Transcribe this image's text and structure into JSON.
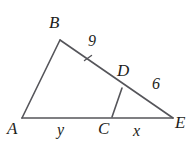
{
  "figure": {
    "background_color": "#ffffff",
    "stroke_color": "#55555a",
    "label_color": "#1d1d20",
    "stroke_width": 1.6,
    "width": 195,
    "height": 146
  },
  "vertices": {
    "B": {
      "label": "B",
      "x": 60,
      "y": 40
    },
    "A": {
      "label": "A",
      "x": 22,
      "y": 118
    },
    "E": {
      "label": "E",
      "x": 173,
      "y": 118
    },
    "D": {
      "label": "D",
      "x": 122,
      "y": 88
    },
    "C": {
      "label": "C",
      "x": 112,
      "y": 117
    }
  },
  "segments": [
    {
      "name": "AB",
      "from": "A",
      "to": "B",
      "x1": 22,
      "y1": 118,
      "x2": 60,
      "y2": 40
    },
    {
      "name": "BE",
      "from": "B",
      "to": "E",
      "x1": 60,
      "y1": 40,
      "x2": 173,
      "y2": 118
    },
    {
      "name": "AE",
      "from": "A",
      "to": "E",
      "x1": 22,
      "y1": 118,
      "x2": 173,
      "y2": 118
    },
    {
      "name": "CD",
      "from": "C",
      "to": "D",
      "x1": 112,
      "y1": 117,
      "x2": 122,
      "y2": 88
    }
  ],
  "tick_marks": [
    {
      "name": "tick-on-BD",
      "x": 88,
      "y": 58,
      "angle": -55,
      "length": 7
    }
  ],
  "measures": {
    "BD": {
      "label": "9",
      "segment": "BD",
      "value": 9
    },
    "DE": {
      "label": "6",
      "segment": "DE",
      "value": 6
    },
    "AC": {
      "label": "y",
      "segment": "AC",
      "value": "y"
    },
    "CE": {
      "label": "x",
      "segment": "CE",
      "value": "x"
    }
  }
}
